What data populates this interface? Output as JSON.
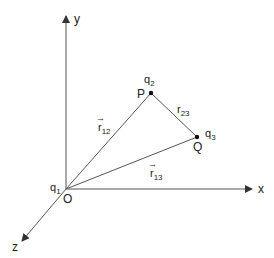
{
  "diagram": {
    "axes": {
      "x_label": "x",
      "y_label": "y",
      "z_label": "z"
    },
    "points": {
      "origin": {
        "name": "O",
        "charge": "q",
        "charge_sub": "1"
      },
      "p": {
        "name": "P",
        "charge": "q",
        "charge_sub": "2"
      },
      "q": {
        "name": "Q",
        "charge": "q",
        "charge_sub": "3"
      }
    },
    "vectors": {
      "r12": {
        "base": "r",
        "sub": "12",
        "arrow": "→"
      },
      "r13": {
        "base": "r",
        "sub": "13",
        "arrow": "→"
      },
      "r23": {
        "base": "r",
        "sub": "23"
      }
    },
    "colors": {
      "line": "#555555",
      "text": "#222222",
      "background": "#ffffff"
    }
  }
}
